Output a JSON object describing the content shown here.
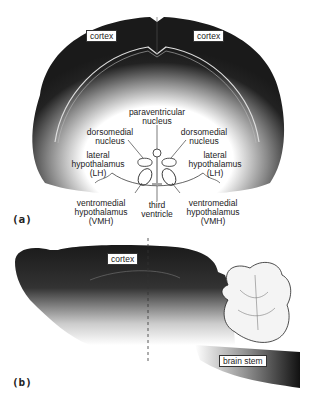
{
  "panel_a": {
    "tag": "(a)",
    "view": "coronal section of rodent brain",
    "labels": {
      "cortex_left": "cortex",
      "cortex_right": "cortex",
      "paraventricular": [
        "paraventricular",
        "nucleus"
      ],
      "dorsomedial_left": [
        "dorsomedial",
        "nucleus"
      ],
      "dorsomedial_right": [
        "dorsomedial",
        "nucleus"
      ],
      "lateral_left": [
        "lateral",
        "hypothalamus",
        "(LH)"
      ],
      "lateral_right": [
        "lateral",
        "hypothalamus",
        "(LH)"
      ],
      "vmh_left": [
        "ventromedial",
        "hypothalamus",
        "(VMH)"
      ],
      "third_ventricle": [
        "third",
        "ventricle"
      ],
      "vmh_right": [
        "ventromedial",
        "hypothalamus",
        "(VMH)"
      ]
    }
  },
  "panel_b": {
    "tag": "(b)",
    "view": "sagittal section of rodent brain",
    "labels": {
      "cortex": "cortex",
      "brain_stem": "brain stem"
    }
  },
  "colors": {
    "shading": "#1a1a1a",
    "background": "#ffffff",
    "line": "#222222"
  }
}
